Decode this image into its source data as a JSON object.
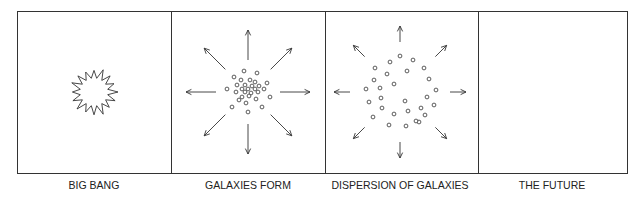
{
  "panels": [
    {
      "id": "big-bang",
      "label": "BIG BANG",
      "content": "starburst"
    },
    {
      "id": "galaxies-form",
      "label": "GALAXIES FORM",
      "content": "dense cluster of galaxies with outward arrows"
    },
    {
      "id": "dispersion",
      "label": "DISPERSION OF GALAXIES",
      "content": "ring of dispersed galaxies with outward arrows"
    },
    {
      "id": "future",
      "label": "THE FUTURE",
      "content": "empty"
    }
  ],
  "colors": {
    "line": "#333333",
    "text": "#222222",
    "background": "#ffffff"
  }
}
